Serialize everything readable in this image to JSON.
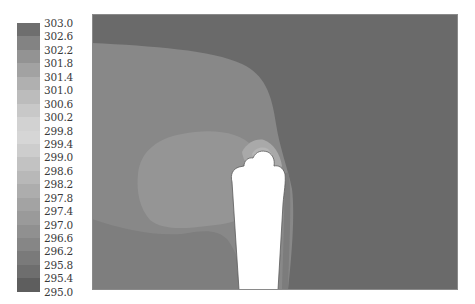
{
  "chart_data": {
    "type": "heatmap",
    "title": "",
    "xlabel": "",
    "ylabel": "",
    "legend": {
      "position": "left",
      "unit": "",
      "min": 295.0,
      "max": 303.0,
      "step": 0.4,
      "labels": [
        "303.0",
        "302.6",
        "302.2",
        "301.8",
        "301.4",
        "301.0",
        "300.6",
        "300.2",
        "299.8",
        "299.4",
        "299.0",
        "298.6",
        "298.2",
        "297.8",
        "297.4",
        "297.0",
        "296.6",
        "296.2",
        "295.8",
        "295.4",
        "295.0"
      ],
      "swatch_colors": [
        "#6e6e6e",
        "#838383",
        "#939393",
        "#a2a2a2",
        "#b0b0b0",
        "#bcbcbc",
        "#c8c8c8",
        "#d2d2d2",
        "#d6d6d6",
        "#cdcdcd",
        "#c2c2c2",
        "#b8b8b8",
        "#adadad",
        "#a3a3a3",
        "#9a9a9a",
        "#909090",
        "#868686",
        "#7a7a7a",
        "#6e6e6e",
        "#5e5e5e"
      ]
    },
    "regions": [
      {
        "name": "background-field",
        "approx_value": 295.2,
        "color": "#6a6a6a"
      },
      {
        "name": "upper-left-band",
        "approx_value": 296.4,
        "color": "#888888"
      },
      {
        "name": "lower-left-band",
        "approx_value": 296.0,
        "color": "#7e7e7e"
      },
      {
        "name": "mid-lobe",
        "approx_value": 297.0,
        "color": "#959595"
      },
      {
        "name": "near-tip-halo",
        "approx_value": 298.2,
        "color": "#a9a9a9"
      },
      {
        "name": "tip-hotspot",
        "approx_value": 299.0,
        "color": "#b6b6b6"
      },
      {
        "name": "probe-slot",
        "approx_value": null,
        "color": "#ffffff"
      }
    ],
    "grid": false
  }
}
